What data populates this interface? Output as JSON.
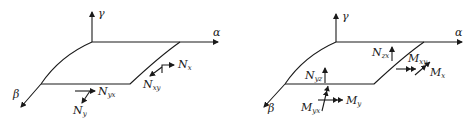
{
  "figure": {
    "panels": [
      {
        "name": "membrane-forces",
        "axes": {
          "vertical": "γ",
          "horizontal": "α",
          "depth": "β"
        },
        "labels": [
          {
            "id": "nx",
            "main": "N",
            "sub": "x"
          },
          {
            "id": "nxy",
            "main": "N",
            "sub": "xy"
          },
          {
            "id": "nyx",
            "main": "N",
            "sub": "yx"
          },
          {
            "id": "ny",
            "main": "N",
            "sub": "y"
          }
        ]
      },
      {
        "name": "shear-forces-and-moments",
        "axes": {
          "vertical": "γ",
          "horizontal": "α",
          "depth": "β"
        },
        "labels": [
          {
            "id": "nzx",
            "main": "N",
            "sub": "zx"
          },
          {
            "id": "nyz",
            "main": "N",
            "sub": "yz"
          },
          {
            "id": "mxy",
            "main": "M",
            "sub": "xy"
          },
          {
            "id": "mx",
            "main": "M",
            "sub": "x"
          },
          {
            "id": "myx",
            "main": "M",
            "sub": "yx"
          },
          {
            "id": "my",
            "main": "M",
            "sub": "y"
          }
        ]
      }
    ]
  }
}
